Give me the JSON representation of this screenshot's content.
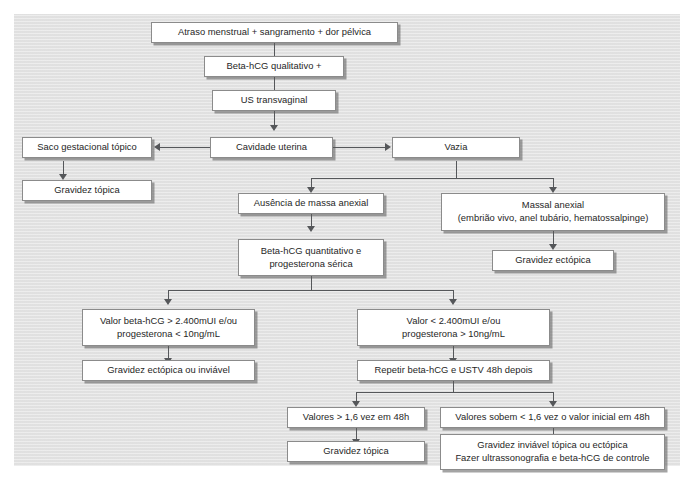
{
  "diagram": {
    "title_text": "Fluxograma de investigacao de gravidez ectopica",
    "background_color": "#e3e3e3",
    "box_fill_color": "#ffffff",
    "box_border_color": "#8b8b8b",
    "connector_color": "#55575a",
    "nodes": [
      {
        "id": "n1",
        "label": "Atraso menstrual + sangramento + dor pélvica"
      },
      {
        "id": "n2",
        "label": "Beta-hCG qualitativo +"
      },
      {
        "id": "n3",
        "label": "US transvaginal"
      },
      {
        "id": "n4",
        "label": "Cavidade uterina"
      },
      {
        "id": "n5",
        "label": "Vazia"
      },
      {
        "id": "n6",
        "label": "Saco gestacional tópico"
      },
      {
        "id": "n7",
        "label": "Gravidez tópica"
      },
      {
        "id": "n8",
        "label": "Ausência de massa anexial"
      },
      {
        "id": "n9",
        "label": "Massal anexial\n(embrião vivo, anel tubário, hematossalpinge)"
      },
      {
        "id": "n10",
        "label": "Beta-hCG quantitativo e\nprogesterona sérica"
      },
      {
        "id": "n11",
        "label": "Gravidez ectópica"
      },
      {
        "id": "n12",
        "label": "Valor beta-hCG > 2.400mUI e/ou\nprogesterona < 10ng/mL"
      },
      {
        "id": "n13",
        "label": "Valor < 2.400mUI e/ou\nprogesterona > 10ng/mL"
      },
      {
        "id": "n14",
        "label": "Gravidez ectópica ou inviável"
      },
      {
        "id": "n15",
        "label": "Repetir beta-hCG e USTV 48h depois"
      },
      {
        "id": "n16",
        "label": "Valores > 1,6 vez em 48h"
      },
      {
        "id": "n17",
        "label": "Valores sobem < 1,6 vez o valor inicial em 48h"
      },
      {
        "id": "n18",
        "label": "Gravidez tópica"
      },
      {
        "id": "n19",
        "label": "Gravidez inviável tópica ou ectópica\nFazer ultrassonografia e beta-hCG de controle"
      }
    ]
  }
}
